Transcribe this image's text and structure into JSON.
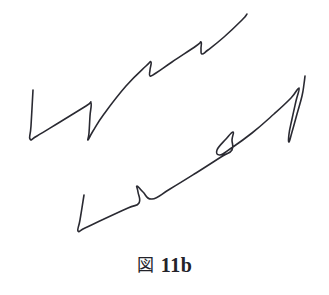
{
  "figure": {
    "caption_kanji": "図",
    "caption_number": "11b",
    "caption_full": "図 11b",
    "background_color": "#ffffff",
    "ink_color": "#2a2a32",
    "stroke_width": 1.6,
    "canvas": {
      "width": 329,
      "height": 295
    }
  },
  "chart_data": {
    "type": "line",
    "title": "図 11b",
    "xlabel": "",
    "ylabel": "",
    "grid": false,
    "legend": "none",
    "axis_visible": false,
    "xlim": [
      0,
      329
    ],
    "ylim": [
      0,
      258
    ],
    "series": [
      {
        "name": "upper-curve",
        "stroke": "#2a2a32",
        "points": [
          [
            33,
            90
          ],
          [
            31,
            126
          ],
          [
            30,
            139
          ],
          [
            37,
            136
          ],
          [
            60,
            122
          ],
          [
            86,
            106
          ],
          [
            91,
            103
          ],
          [
            90,
            116
          ],
          [
            89,
            133
          ],
          [
            88,
            140
          ],
          [
            93,
            131
          ],
          [
            104,
            114
          ],
          [
            126,
            86
          ],
          [
            146,
            66
          ],
          [
            151,
            62
          ],
          [
            150,
            70
          ],
          [
            150,
            76
          ],
          [
            156,
            73
          ],
          [
            172,
            62
          ],
          [
            196,
            46
          ],
          [
            201,
            42
          ],
          [
            201,
            49
          ],
          [
            202,
            54
          ],
          [
            208,
            50
          ],
          [
            224,
            37
          ],
          [
            242,
            20
          ],
          [
            247,
            14
          ]
        ]
      },
      {
        "name": "lower-curve",
        "stroke": "#2a2a32",
        "points": [
          [
            84,
            195
          ],
          [
            80,
            220
          ],
          [
            78,
            231
          ],
          [
            85,
            228
          ],
          [
            104,
            219
          ],
          [
            128,
            208
          ],
          [
            139,
            203
          ],
          [
            138,
            192
          ],
          [
            137,
            186
          ],
          [
            143,
            192
          ],
          [
            152,
            199
          ],
          [
            170,
            189
          ],
          [
            196,
            173
          ],
          [
            221,
            157
          ],
          [
            232,
            150
          ],
          [
            232,
            140
          ],
          [
            233,
            132
          ],
          [
            226,
            139
          ],
          [
            217,
            150
          ],
          [
            220,
            155
          ],
          [
            230,
            149
          ],
          [
            252,
            133
          ],
          [
            274,
            114
          ],
          [
            291,
            98
          ],
          [
            299,
            88
          ],
          [
            296,
            101
          ],
          [
            292,
            119
          ],
          [
            289,
            134
          ],
          [
            289,
            142
          ],
          [
            292,
            132
          ],
          [
            297,
            114
          ],
          [
            302,
            96
          ],
          [
            304,
            84
          ],
          [
            305,
            76
          ]
        ]
      }
    ]
  }
}
